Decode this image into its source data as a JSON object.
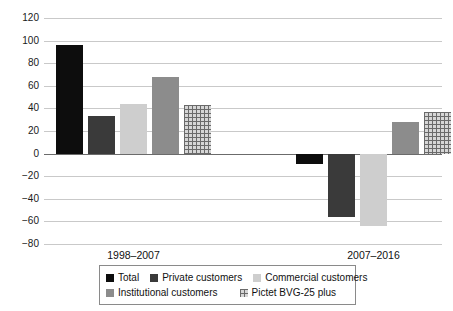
{
  "chart_data": {
    "type": "bar",
    "title": "",
    "subtitle": "",
    "xlabel": "",
    "ylabel": "",
    "categories": [
      "1998–2007",
      "2007–2016"
    ],
    "series": [
      {
        "name": "Total",
        "values": [
          96,
          -9
        ],
        "color": "#0d0d0d",
        "pattern": "solid"
      },
      {
        "name": "Private customers",
        "values": [
          33,
          -56
        ],
        "color": "#3a3a3a",
        "pattern": "solid"
      },
      {
        "name": "Commercial customers",
        "values": [
          44,
          -64
        ],
        "color": "#cecece",
        "pattern": "solid"
      },
      {
        "name": "Institutional customers",
        "values": [
          68,
          28
        ],
        "color": "#8c8c8c",
        "pattern": "solid"
      },
      {
        "name": "Pictet BVG-25 plus",
        "values": [
          43,
          37
        ],
        "color": "#d6d6d6",
        "pattern": "crosshatch"
      }
    ],
    "ylim": [
      -80,
      120
    ],
    "ytick_step": 20,
    "yticks": [
      120,
      100,
      80,
      60,
      40,
      20,
      0,
      -20,
      -40,
      -60,
      -80
    ],
    "ytick_labels": [
      "120",
      "100",
      "80",
      "60",
      "40",
      "20",
      "0",
      "−20",
      "−40",
      "−60",
      "−80"
    ],
    "grid": true,
    "grid_axis": "y",
    "zero_line": true,
    "legend": {
      "position": "bottom",
      "bordered": true,
      "rows": [
        [
          "Total",
          "Private customers",
          "Commercial customers"
        ],
        [
          "Institutional customers",
          "Pictet BVG-25 plus"
        ]
      ],
      "entries": [
        {
          "label": "Total",
          "swatch": "legend-swatch-total"
        },
        {
          "label": "Private customers",
          "swatch": "legend-swatch-private"
        },
        {
          "label": "Commercial customers",
          "swatch": "legend-swatch-commercial"
        },
        {
          "label": "Institutional customers",
          "swatch": "legend-swatch-institutional"
        },
        {
          "label": "Pictet BVG-25 plus",
          "swatch": "legend-swatch-pictet"
        }
      ]
    }
  }
}
